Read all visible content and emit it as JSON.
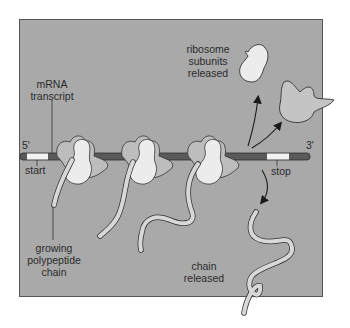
{
  "diagram": {
    "colors": {
      "background": "#a9a9a9",
      "frame_border": "#555555",
      "mrna_strand": "#5a5a5a",
      "codon_segment": "#f2f2f2",
      "ribosome_large": "#bdbdbd",
      "ribosome_small": "#ececec",
      "polypeptide": "#d8d8d8",
      "outline": "#333333",
      "text": "#2b2b2b"
    },
    "labels": {
      "mrna_transcript": [
        "mRNA",
        "transcript"
      ],
      "five_prime": "5'",
      "three_prime": "3'",
      "start": "start",
      "stop": "stop",
      "growing_chain": [
        "growing",
        "polypeptide",
        "chain"
      ],
      "subunits_released": [
        "ribosome",
        "subunits",
        "released"
      ],
      "chain_released": [
        "chain",
        "released"
      ]
    },
    "ribosomes": [
      {
        "id": 1,
        "x": 80
      },
      {
        "id": 2,
        "x": 145
      },
      {
        "id": 3,
        "x": 212
      }
    ]
  }
}
